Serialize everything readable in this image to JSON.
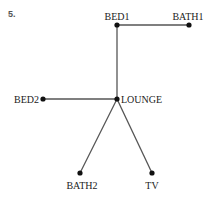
{
  "figure": {
    "number_label": "5.",
    "nodes": [
      {
        "id": "BED1",
        "label": "BED1",
        "x": 117,
        "y": 25,
        "lx": 117,
        "ly": 20,
        "anchor": "middle"
      },
      {
        "id": "BATH1",
        "label": "BATH1",
        "x": 189,
        "y": 25,
        "lx": 188,
        "ly": 20,
        "anchor": "middle"
      },
      {
        "id": "LOUNGE",
        "label": "LOUNGE",
        "x": 117,
        "y": 99,
        "lx": 121,
        "ly": 103,
        "anchor": "start"
      },
      {
        "id": "BED2",
        "label": "BED2",
        "x": 43,
        "y": 99,
        "lx": 39,
        "ly": 103,
        "anchor": "end"
      },
      {
        "id": "BATH2",
        "label": "BATH2",
        "x": 80,
        "y": 173,
        "lx": 82,
        "ly": 189,
        "anchor": "middle"
      },
      {
        "id": "TV",
        "label": "TV",
        "x": 152,
        "y": 173,
        "lx": 152,
        "ly": 189,
        "anchor": "middle"
      }
    ],
    "edges": [
      {
        "from": "BED1",
        "to": "BATH1"
      },
      {
        "from": "BED1",
        "to": "LOUNGE"
      },
      {
        "from": "BED2",
        "to": "LOUNGE"
      },
      {
        "from": "LOUNGE",
        "to": "BATH2"
      },
      {
        "from": "LOUNGE",
        "to": "TV"
      }
    ]
  }
}
